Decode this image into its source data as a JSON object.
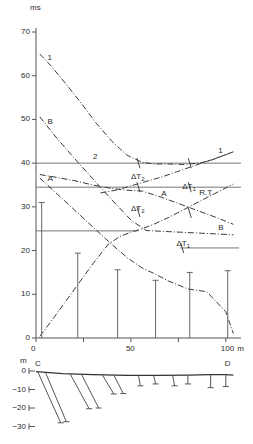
{
  "figure": {
    "type": "seismic-traveltime-and-section",
    "top_axis_unit": "ms",
    "bottom_axis_unit": "m"
  },
  "chart_data": {
    "type": "line",
    "title": "",
    "xlabel": "m",
    "ylabel": "ms",
    "xlim": [
      0,
      108
    ],
    "ylim": [
      0,
      70
    ],
    "xticks": [
      0,
      50,
      100
    ],
    "xticklabels": [
      "0",
      "50",
      "100",
      "m"
    ],
    "yticks": [
      0,
      10,
      20,
      30,
      40,
      50,
      60,
      70
    ],
    "yticklabels": [
      "0",
      "10",
      "20",
      "30",
      "40",
      "50",
      "60",
      "70"
    ],
    "grid": false,
    "legend": "inline-curve-labels",
    "reference_lines": [
      {
        "name": "line-40ms",
        "value": 40,
        "label": ""
      },
      {
        "name": "line-34_5ms",
        "value": 34.5,
        "label": "R.T."
      },
      {
        "name": "line-24_5ms",
        "value": 24.5,
        "label": ""
      }
    ],
    "series": [
      {
        "name": "curve-1-forward",
        "label": "1",
        "style": "dash-dot",
        "x": [
          2,
          8,
          16,
          24,
          32,
          40,
          48,
          56,
          62,
          70,
          78,
          86,
          92,
          98,
          104
        ],
        "y": [
          65.0,
          62.2,
          58.0,
          53.6,
          49.0,
          45.0,
          41.8,
          40.2,
          39.8,
          39.8,
          39.7,
          40.0,
          40.6,
          41.6,
          42.6
        ]
      },
      {
        "name": "curve-B-forward",
        "label": "B",
        "style": "dash-dot",
        "x": [
          2,
          10,
          20,
          30,
          40,
          50,
          58,
          66,
          76,
          86,
          96,
          104
        ],
        "y": [
          50.6,
          46.2,
          41.2,
          36.4,
          31.6,
          27.0,
          24.6,
          24.4,
          24.2,
          24.0,
          23.8,
          23.6
        ]
      },
      {
        "name": "curve-A-forward",
        "label": "A",
        "style": "dash-dot",
        "x": [
          2,
          10,
          20,
          30,
          40,
          48,
          56,
          66,
          76,
          86,
          96,
          104
        ],
        "y": [
          37.4,
          36.8,
          36.0,
          35.0,
          34.2,
          33.8,
          33.6,
          32.2,
          30.6,
          29.0,
          27.4,
          26.0
        ]
      },
      {
        "name": "curve-2-reverse",
        "label": "2",
        "style": "dash-dot",
        "x": [
          2,
          10,
          20,
          30,
          40,
          48,
          56,
          62,
          70,
          80,
          90,
          100,
          104
        ],
        "y": [
          36.6,
          33.4,
          29.4,
          25.4,
          21.4,
          18.4,
          16.0,
          14.8,
          13.0,
          11.2,
          10.6,
          6.0,
          1.0
        ]
      },
      {
        "name": "curve-A-reverse",
        "label": "A",
        "style": "dash-dot",
        "x": [
          34,
          42,
          50,
          58,
          66,
          74,
          82,
          90,
          98,
          104
        ],
        "y": [
          33.2,
          33.8,
          34.8,
          35.8,
          36.8,
          38.0,
          39.2,
          40.4,
          41.6,
          42.6
        ]
      },
      {
        "name": "curve-2-rising",
        "label": "",
        "style": "dash-dot",
        "x": [
          2,
          10,
          20,
          30,
          38,
          44,
          50,
          56,
          62,
          70,
          78,
          86,
          94,
          104
        ],
        "y": [
          0.4,
          5.0,
          11.0,
          17.0,
          21.4,
          23.2,
          24.2,
          25.0,
          26.0,
          27.6,
          29.4,
          31.2,
          33.0,
          35.2
        ]
      }
    ],
    "curve_labels": [
      {
        "name": "label-1-left",
        "text": "1",
        "x": 6,
        "y": 64.0
      },
      {
        "name": "label-B-left",
        "text": "B",
        "x": 6,
        "y": 49.4
      },
      {
        "name": "label-A-left",
        "text": "A",
        "x": 6,
        "y": 36.4
      },
      {
        "name": "label-2-mid",
        "text": "2",
        "x": 30,
        "y": 41.4
      },
      {
        "name": "label-1-right",
        "text": "1",
        "x": 96,
        "y": 42.8
      },
      {
        "name": "label-A-right",
        "text": "A",
        "x": 66,
        "y": 33.0
      },
      {
        "name": "label-B-right",
        "text": "B",
        "x": 96,
        "y": 25.2
      },
      {
        "name": "label-RT",
        "text": "R.T.",
        "x": 86,
        "y": 33.2
      }
    ],
    "delta_labels": [
      {
        "name": "delta-t2-upper",
        "text": "ΔT",
        "sub": "2",
        "x": 50,
        "y": 36.8
      },
      {
        "name": "delta-t1-upper",
        "text": "ΔT",
        "sub": "1",
        "x": 77,
        "y": 34.6
      },
      {
        "name": "delta-t2-lower",
        "text": "ΔT",
        "sub": "2",
        "x": 50,
        "y": 29.6
      },
      {
        "name": "delta-t1-lower",
        "text": "ΔT",
        "sub": "1",
        "x": 74,
        "y": 21.6
      }
    ],
    "geophone_bars": [
      {
        "name": "bar-0",
        "x": 3,
        "top": 31.0
      },
      {
        "name": "bar-1",
        "x": 22,
        "top": 19.4
      },
      {
        "name": "bar-2",
        "x": 43,
        "top": 15.6
      },
      {
        "name": "bar-3",
        "x": 63,
        "top": 13.2
      },
      {
        "name": "bar-4",
        "x": 81,
        "top": 15.0
      },
      {
        "name": "bar-5",
        "x": 101,
        "top": 15.4
      }
    ]
  },
  "section_data": {
    "type": "depth-section",
    "ylabel": "m",
    "yticks": [
      0,
      -10,
      -20,
      -30
    ],
    "yticklabels": [
      "0",
      "−10",
      "−20",
      "−30"
    ],
    "endpoints": [
      {
        "name": "point-C",
        "label": "C",
        "x": 0
      },
      {
        "name": "point-D",
        "label": "D",
        "x": 100
      }
    ],
    "surface": {
      "name": "surface-line",
      "x": [
        0,
        14,
        30,
        48,
        64,
        80,
        92,
        100,
        104
      ],
      "y": [
        -0.4,
        -1.4,
        -2.0,
        -2.4,
        -2.4,
        -2.2,
        -2.0,
        -2.0,
        -2.2
      ]
    },
    "rays": [
      {
        "name": "ray-1",
        "x1": 1,
        "y1": -0.6,
        "x2": 13,
        "y2": -28.0
      },
      {
        "name": "ray-2",
        "x1": 5,
        "y1": -0.8,
        "x2": 16,
        "y2": -27.4
      },
      {
        "name": "ray-3",
        "x1": 18,
        "y1": -1.6,
        "x2": 28,
        "y2": -20.4
      },
      {
        "name": "ray-4",
        "x1": 24,
        "y1": -1.8,
        "x2": 33,
        "y2": -20.0
      },
      {
        "name": "ray-5",
        "x1": 35,
        "y1": -2.2,
        "x2": 41,
        "y2": -12.4
      },
      {
        "name": "ray-6",
        "x1": 41,
        "y1": -2.2,
        "x2": 46,
        "y2": -12.2
      },
      {
        "name": "ray-7",
        "x1": 54,
        "y1": -2.4,
        "x2": 55,
        "y2": -8.0
      },
      {
        "name": "ray-8",
        "x1": 62,
        "y1": -2.4,
        "x2": 63,
        "y2": -7.0
      },
      {
        "name": "ray-9",
        "x1": 72,
        "y1": -2.4,
        "x2": 73,
        "y2": -8.0
      },
      {
        "name": "ray-10",
        "x1": 80,
        "y1": -2.2,
        "x2": 80,
        "y2": -7.0
      },
      {
        "name": "ray-11",
        "x1": 92,
        "y1": -2.0,
        "x2": 92,
        "y2": -9.0
      },
      {
        "name": "ray-12",
        "x1": 100,
        "y1": -2.0,
        "x2": 100,
        "y2": -8.4
      }
    ]
  }
}
